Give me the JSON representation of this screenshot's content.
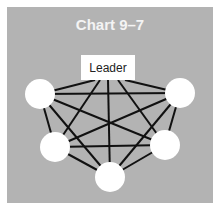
{
  "title": "Chart 9–7",
  "leader_label": "Leader",
  "colors": {
    "panel": "#b3b3b3",
    "node": "#ffffff",
    "line": "#111111",
    "title": "#f4f4f4"
  },
  "nodes": [
    {
      "id": "leader",
      "x": 108,
      "y": 67
    },
    {
      "id": "top-left",
      "x": 40,
      "y": 94
    },
    {
      "id": "top-right",
      "x": 180,
      "y": 93
    },
    {
      "id": "bottom-left",
      "x": 55,
      "y": 147
    },
    {
      "id": "bottom-right",
      "x": 165,
      "y": 145
    },
    {
      "id": "bottom-center",
      "x": 110,
      "y": 177
    }
  ]
}
